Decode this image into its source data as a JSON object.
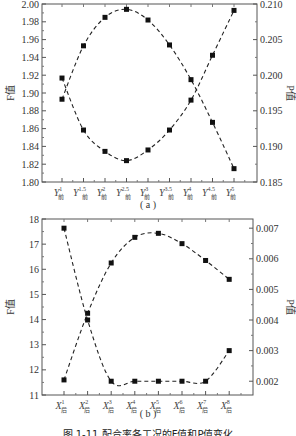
{
  "figure": {
    "panel_a_label": "( a )",
    "panel_b_label": "( b )",
    "caption": "图 1-11  配合率各工况的F值和P值变化"
  },
  "chart_data": [
    {
      "panel": "a",
      "type": "line",
      "title": "",
      "xlabel": "",
      "categories": [
        "Y^1_前",
        "Y^1.5_前",
        "Y^2_前",
        "Y^2.5_前",
        "Y^3_前",
        "Y^3.5_前",
        "Y^4_前",
        "Y^4.5_前",
        "Y^5_前"
      ],
      "category_base": [
        "Y",
        "Y",
        "Y",
        "Y",
        "Y",
        "Y",
        "Y",
        "Y",
        "Y"
      ],
      "category_sup": [
        "1",
        "1.5",
        "2",
        "2.5",
        "3",
        "3.5",
        "4",
        "4.5",
        "5"
      ],
      "category_sub": [
        "前",
        "前",
        "前",
        "前",
        "前",
        "前",
        "前",
        "前",
        "前"
      ],
      "ylabel_left": "F值",
      "ylabel_right": "P值",
      "ylim_left": [
        1.8,
        2.0
      ],
      "ylim_right": [
        0.185,
        0.21
      ],
      "yticks_left": [
        "1.80",
        "1.82",
        "1.84",
        "1.86",
        "1.88",
        "1.90",
        "1.92",
        "1.94",
        "1.96",
        "1.98",
        "2.00"
      ],
      "yticks_right": [
        "0.185",
        "0.190",
        "0.195",
        "0.200",
        "0.205",
        "0.210"
      ],
      "series": [
        {
          "name": "F值",
          "axis": "left",
          "style": "dashed",
          "marker": "square",
          "values": [
            1.893,
            1.953,
            1.985,
            1.994,
            1.982,
            1.954,
            1.915,
            1.867,
            1.815
          ]
        },
        {
          "name": "P值",
          "axis": "right",
          "style": "dashed",
          "marker": "square",
          "values": [
            0.1996,
            0.1923,
            0.1893,
            0.188,
            0.1895,
            0.1923,
            0.1965,
            0.2028,
            0.2091
          ]
        }
      ],
      "grid": false,
      "legend": "none"
    },
    {
      "panel": "b",
      "type": "line",
      "title": "",
      "xlabel": "",
      "categories": [
        "X^1_后",
        "X^2_后",
        "X^3_后",
        "X^4_后",
        "X^5_后",
        "X^6_后",
        "X^7_后",
        "X^8_后"
      ],
      "category_base": [
        "X",
        "X",
        "X",
        "X",
        "X",
        "X",
        "X",
        "X"
      ],
      "category_sup": [
        "1",
        "2",
        "3",
        "4",
        "5",
        "6",
        "7",
        "8"
      ],
      "category_sub": [
        "后",
        "后",
        "后",
        "后",
        "后",
        "后",
        "后",
        "后"
      ],
      "ylabel_left": "F值",
      "ylabel_right": "P值",
      "ylim_left": [
        11,
        18
      ],
      "ylim_right": [
        0.00155,
        0.0073
      ],
      "yticks_left": [
        "11",
        "12",
        "13",
        "14",
        "15",
        "16",
        "17",
        "18"
      ],
      "yticks_right": [
        "0.002",
        "0.003",
        "0.004",
        "0.005",
        "0.006",
        "0.007"
      ],
      "series": [
        {
          "name": "F值",
          "axis": "left",
          "style": "dashed",
          "marker": "square",
          "values": [
            11.6,
            14.25,
            16.25,
            17.27,
            17.43,
            17.02,
            16.35,
            15.6
          ]
        },
        {
          "name": "P值",
          "axis": "right",
          "style": "dashed",
          "marker": "square",
          "values": [
            0.007,
            0.004,
            0.002,
            0.002,
            0.002,
            0.002,
            0.002,
            0.003
          ]
        }
      ],
      "grid": false,
      "legend": "none"
    }
  ]
}
